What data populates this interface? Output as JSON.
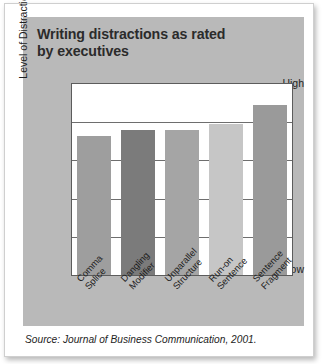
{
  "figure": {
    "title_line1": "Writing distractions as rated",
    "title_line2": "by executives",
    "source": "Source: Journal of Business Communication, 2001.",
    "panel_color": "#b9b9b9",
    "plot_background": "#ffffff",
    "frame_color": "#5c5c5c"
  },
  "chart_data": {
    "type": "bar",
    "title": "Writing distractions as rated by executives",
    "xlabel": "",
    "ylabel": "Level of Distraction",
    "categories": [
      "Comma Splice",
      "Dangling Modifier",
      "Unparallel Structure",
      "Run-on Sentence",
      "Sentence Fragment"
    ],
    "category_lines": [
      [
        "Comma",
        "Splice"
      ],
      [
        "Dangling",
        "Modifier"
      ],
      [
        "Unparallel",
        "Structure"
      ],
      [
        "Run-on",
        "Sentence"
      ],
      [
        "Sentence",
        "Fragment"
      ]
    ],
    "values": [
      73,
      76,
      76,
      79,
      89
    ],
    "bar_colors": [
      "#9e9e9e",
      "#7b7b7b",
      "#a5a5a5",
      "#c6c6c6",
      "#9a9a9a"
    ],
    "ylim": [
      0,
      100
    ],
    "ytick_labels": [
      "High",
      "Low"
    ],
    "ytick_values": [
      100,
      0
    ],
    "gridlines": [
      80,
      60,
      40,
      20
    ],
    "grid": true,
    "legend": false
  }
}
